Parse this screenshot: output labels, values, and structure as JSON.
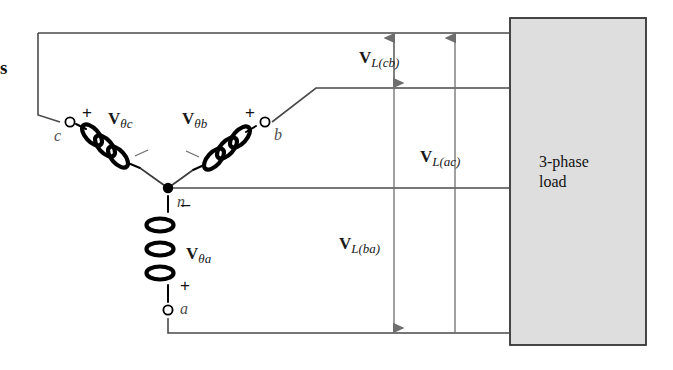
{
  "figure": {
    "background": "#ffffff",
    "edge_glyph": "s"
  },
  "source": {
    "type": "wye",
    "neutral_label": "n",
    "phases": [
      {
        "id": "a",
        "terminal_label": "a",
        "voltage_symbol": "V",
        "voltage_subscript": "θa",
        "polarity_plus": "+",
        "polarity_minus": "−",
        "orientation": "vertical"
      },
      {
        "id": "b",
        "terminal_label": "b",
        "voltage_symbol": "V",
        "voltage_subscript": "θb",
        "polarity_plus": "+",
        "polarity_minus": "−",
        "orientation": "diagonal-right"
      },
      {
        "id": "c",
        "terminal_label": "c",
        "voltage_symbol": "V",
        "voltage_subscript": "θc",
        "polarity_plus": "+",
        "polarity_minus": "−",
        "orientation": "diagonal-left"
      }
    ]
  },
  "line_voltages": [
    {
      "id": "cb",
      "symbol": "V",
      "subscript": "L(cb)",
      "direction": "double",
      "between": [
        "c",
        "b"
      ]
    },
    {
      "id": "ac",
      "symbol": "V",
      "subscript": "L(ac)",
      "direction": "up",
      "between": [
        "a",
        "c"
      ]
    },
    {
      "id": "ba",
      "symbol": "V",
      "subscript": "L(ba)",
      "direction": "down",
      "between": [
        "b",
        "a"
      ]
    }
  ],
  "load": {
    "line1": "3-phase",
    "line2": "load",
    "fill_color": "#dedede",
    "border_color": "#333333"
  },
  "colors": {
    "wire": "#4a4a4a",
    "coil": "#000000",
    "dimension": "#6e6e6e",
    "text": "#1a1a1a"
  }
}
